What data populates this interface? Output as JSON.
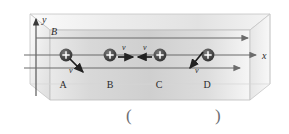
{
  "figure": {
    "type": "physics-diagram",
    "axes": {
      "y_label": "y",
      "x_label": "x"
    },
    "field": {
      "label": "B",
      "direction": "+x",
      "line_count": 3
    },
    "charges": [
      {
        "name": "A",
        "sign": "+",
        "velocity_label": "v",
        "velocity_direction": "down-right"
      },
      {
        "name": "B",
        "sign": "+",
        "velocity_label": "v",
        "velocity_direction": "right"
      },
      {
        "name": "C",
        "sign": "+",
        "velocity_label": "v",
        "velocity_direction": "left"
      },
      {
        "name": "D",
        "sign": "+",
        "velocity_label": "v",
        "velocity_direction": "down-left"
      }
    ],
    "labels_row": [
      "A",
      "B",
      "C",
      "D"
    ]
  },
  "answer": {
    "open_paren": "(",
    "close_paren": ")",
    "value": ""
  },
  "colors": {
    "box_fill_light": "#efefef",
    "box_fill_mid": "#e3e3e3",
    "box_fill_dark": "#d2d2d2",
    "outline": "#b9b9b9",
    "line": "#7a7a7a",
    "charge": "#4a4a4a",
    "text": "#3a3a3a",
    "paren": "#6d6d72"
  }
}
